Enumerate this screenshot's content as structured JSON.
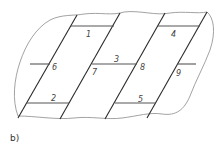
{
  "figure": {
    "caption": "b)",
    "labels": [
      {
        "id": "1",
        "text": "1",
        "x": 86,
        "y": 37
      },
      {
        "id": "2",
        "text": "2",
        "x": 51,
        "y": 101
      },
      {
        "id": "3",
        "text": "3",
        "x": 114,
        "y": 62
      },
      {
        "id": "4",
        "text": "4",
        "x": 171,
        "y": 37
      },
      {
        "id": "5",
        "text": "5",
        "x": 138,
        "y": 102
      },
      {
        "id": "6",
        "text": "6",
        "x": 52,
        "y": 70
      },
      {
        "id": "7",
        "text": "7",
        "x": 92,
        "y": 75
      },
      {
        "id": "8",
        "text": "8",
        "x": 140,
        "y": 70
      },
      {
        "id": "9",
        "text": "9",
        "x": 176,
        "y": 76
      }
    ],
    "colors": {
      "line": "#2a2a2a",
      "outline": "#8a8a8a"
    }
  }
}
